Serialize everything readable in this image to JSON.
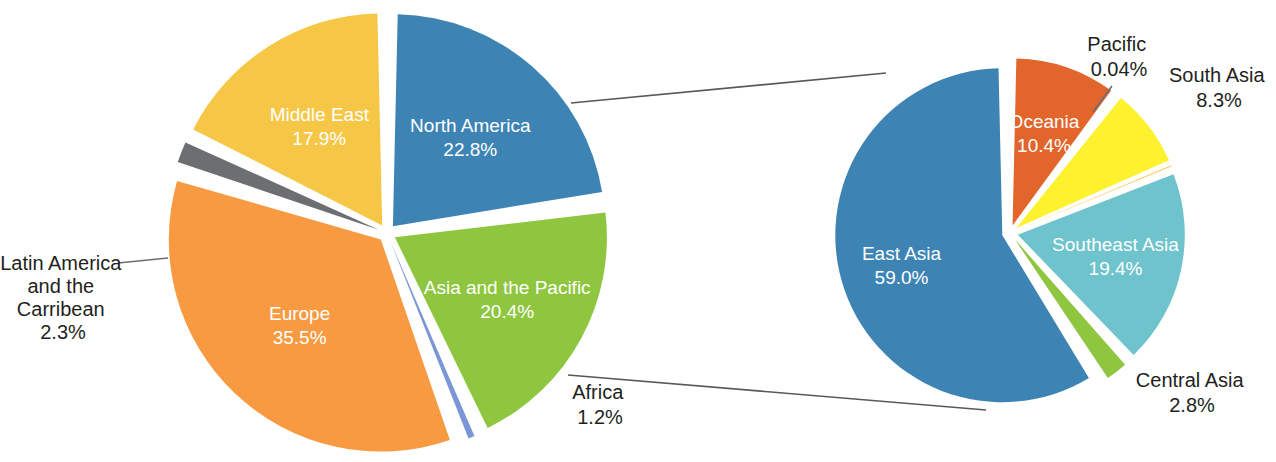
{
  "chart_data": [
    {
      "id": "world-regions",
      "type": "pie",
      "title": "",
      "position": "left",
      "center": [
        387,
        233
      ],
      "radius": 212,
      "explode": true,
      "legend": "none",
      "labels_inside": true,
      "categories": [
        "North America",
        "Asia and the Pacific",
        "Africa",
        "Europe",
        "Latin America and the Carribean",
        "Middle East"
      ],
      "values": [
        22.8,
        20.4,
        1.2,
        35.5,
        2.3,
        17.9
      ],
      "value_labels": [
        "22.8%",
        "20.4%",
        "1.2%",
        "35.5%",
        "2.3%",
        "17.9%"
      ],
      "colors": [
        "#3d84b5",
        "#8ec640",
        "#7b96d4",
        "#f89a41",
        "#6d6e71",
        "#f6c747"
      ],
      "slices": [
        {
          "name": "North America",
          "value": 22.8,
          "value_label": "22.8%",
          "color": "#3d84b5",
          "label_lines": [
            "North America",
            "22.8%"
          ],
          "label_placement": "inside",
          "label_color": "#ffffff"
        },
        {
          "name": "Asia and the Pacific",
          "value": 20.4,
          "value_label": "20.4%",
          "color": "#8ec640",
          "label_lines": [
            "Asia and the Pacific",
            "20.4%"
          ],
          "label_placement": "inside",
          "label_color": "#ffffff"
        },
        {
          "name": "Africa",
          "value": 1.2,
          "value_label": "1.2%",
          "color": "#7b96d4",
          "label_lines": [
            "Africa",
            "1.2%"
          ],
          "label_placement": "outside",
          "label_color": "#231f20"
        },
        {
          "name": "Europe",
          "value": 35.5,
          "value_label": "35.5%",
          "color": "#f89a41",
          "label_lines": [
            "Europe",
            "35.5%"
          ],
          "label_placement": "inside",
          "label_color": "#ffffff"
        },
        {
          "name": "Latin America and the Carribean",
          "value": 2.3,
          "value_label": "2.3%",
          "color": "#6d6e71",
          "label_lines": [
            "Latin America",
            "and the",
            "Carribean",
            "2.3%"
          ],
          "label_placement": "outside",
          "label_color": "#231f20"
        },
        {
          "name": "Middle East",
          "value": 17.9,
          "value_label": "17.9%",
          "color": "#f6c747",
          "label_lines": [
            "Middle East",
            "17.9%"
          ],
          "label_placement": "inside",
          "label_color": "#ffffff"
        }
      ]
    },
    {
      "id": "asia-and-the-pacific-breakdown",
      "type": "pie",
      "title": "",
      "position": "right",
      "center": [
        1010,
        233
      ],
      "radius": 167,
      "explode": true,
      "legend": "none",
      "labels_inside": true,
      "exploded_from": "Asia and the Pacific",
      "categories": [
        "Oceania",
        "South Asia",
        "Pacific",
        "Southeast Asia",
        "Central Asia",
        "East Asia"
      ],
      "values": [
        10.4,
        8.3,
        0.04,
        19.4,
        2.8,
        59.0
      ],
      "value_labels": [
        "10.4%",
        "8.3%",
        "0.04%",
        "19.4%",
        "2.8%",
        "59.0%"
      ],
      "colors": [
        "#e2652c",
        "#fdf22d",
        "#f6c747",
        "#6ec3cc",
        "#8ec640",
        "#3d84b5"
      ],
      "slices": [
        {
          "name": "Oceania",
          "value": 10.4,
          "value_label": "10.4%",
          "color": "#e2652c",
          "label_lines": [
            "Oceania",
            "10.4%"
          ],
          "label_placement": "inside",
          "label_color": "#ffffff"
        },
        {
          "name": "South Asia",
          "value": 8.3,
          "value_label": "8.3%",
          "color": "#fdf22d",
          "label_lines": [
            "South Asia",
            "8.3%"
          ],
          "label_placement": "outside",
          "label_color": "#231f20"
        },
        {
          "name": "Pacific",
          "value": 0.04,
          "value_label": "0.04%",
          "color": "#f6c747",
          "label_lines": [
            "Pacific",
            "0.04%"
          ],
          "label_placement": "outside",
          "label_color": "#231f20"
        },
        {
          "name": "Southeast Asia",
          "value": 19.4,
          "value_label": "19.4%",
          "color": "#6ec3cc",
          "label_lines": [
            "Southeast Asia",
            "19.4%"
          ],
          "label_placement": "inside",
          "label_color": "#ffffff"
        },
        {
          "name": "Central Asia",
          "value": 2.8,
          "value_label": "2.8%",
          "color": "#8ec640",
          "label_lines": [
            "Central Asia",
            "2.8%"
          ],
          "label_placement": "outside",
          "label_color": "#231f20"
        },
        {
          "name": "East Asia",
          "value": 59.0,
          "value_label": "59.0%",
          "color": "#3d84b5",
          "label_lines": [
            "East Asia",
            "59.0%"
          ],
          "label_placement": "inside",
          "label_color": "#ffffff"
        }
      ]
    }
  ],
  "labels": {
    "north_america": {
      "name": "North America",
      "pct": "22.8%"
    },
    "asia_pacific": {
      "name": "Asia and the Pacific",
      "pct": "20.4%"
    },
    "africa": {
      "name": "Africa",
      "pct": "1.2%"
    },
    "europe": {
      "name": "Europe",
      "pct": "35.5%"
    },
    "latin_america": {
      "l1": "Latin America",
      "l2": "and the",
      "l3": "Carribean",
      "pct": "2.3%"
    },
    "middle_east": {
      "name": "Middle East",
      "pct": "17.9%"
    },
    "oceania": {
      "name": "Oceania",
      "pct": "10.4%"
    },
    "south_asia": {
      "name": "South Asia",
      "pct": "8.3%"
    },
    "pacific": {
      "name": "Pacific",
      "pct": "0.04%"
    },
    "southeast_asia": {
      "name": "Southeast Asia",
      "pct": "19.4%"
    },
    "central_asia": {
      "name": "Central Asia",
      "pct": "2.8%"
    },
    "east_asia": {
      "name": "East Asia",
      "pct": "59.0%"
    }
  }
}
